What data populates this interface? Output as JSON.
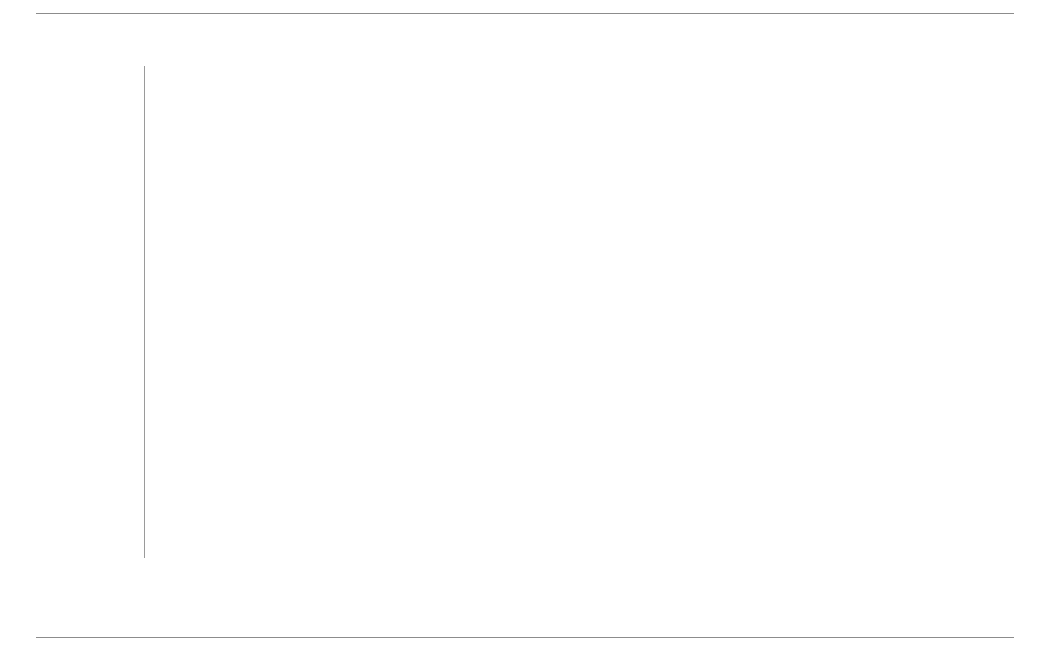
{
  "figure": {
    "rules": {
      "top": true,
      "bottom": true
    }
  },
  "axis": {
    "ticks": [
      "0%",
      "20%",
      "40%",
      "60%",
      "80%",
      "100%"
    ],
    "tick_values": [
      0,
      20,
      40,
      60,
      80,
      100
    ]
  },
  "legend": {
    "items": [
      {
        "label": "hohe emotionale Bindung",
        "color": "#8a8a8a"
      },
      {
        "label": "geringe emotionale Bindung",
        "color": "#6f6f6f"
      },
      {
        "label": "keine emotionale Bindung",
        "color": "#b4b4b4"
      }
    ]
  },
  "chart_data": {
    "type": "bar",
    "orientation": "horizontal",
    "stacked": true,
    "stack_total": 100,
    "title": "",
    "subtitle": "",
    "xlabel": "",
    "ylabel": "",
    "xlim": [
      0,
      100
    ],
    "grid": true,
    "legend_position": "bottom",
    "tick_labels": [
      "0%",
      "20%",
      "40%",
      "60%",
      "80%",
      "100%"
    ],
    "categories": [
      "USA",
      "Schweiz",
      "Österreich",
      "…",
      "Deutschland",
      "…",
      "Tschechien",
      "Singapur",
      "China"
    ],
    "series": [
      {
        "name": "hohe emotionale Bindung",
        "color": "#8a8a8a",
        "values": [
          28,
          23,
          23,
          null,
          13,
          null,
          3,
          2,
          2
        ]
      },
      {
        "name": "geringe emotionale Bindung",
        "color": "#6f6f6f",
        "values": [
          54,
          68,
          62,
          null,
          66,
          null,
          60,
          78,
          67
        ]
      },
      {
        "name": "keine emotionale Bindung",
        "color": "#b4b4b4",
        "values": [
          18,
          9,
          15,
          null,
          21,
          null,
          37,
          21,
          31
        ]
      }
    ],
    "rows": [
      {
        "category": "USA",
        "placeholder": false,
        "segments": [
          {
            "series": "hohe emotionale Bindung",
            "value": 28,
            "label": "28%",
            "color": "#8a8a8a"
          },
          {
            "series": "geringe emotionale Bindung",
            "value": 54,
            "label": "54%",
            "color": "#6f6f6f"
          },
          {
            "series": "keine emotionale Bindung",
            "value": 18,
            "label": "18%",
            "color": "#b4b4b4"
          }
        ]
      },
      {
        "category": "Schweiz",
        "placeholder": false,
        "segments": [
          {
            "series": "hohe emotionale Bindung",
            "value": 23,
            "label": "23%",
            "color": "#8a8a8a"
          },
          {
            "series": "geringe emotionale Bindung",
            "value": 68,
            "label": "68%",
            "color": "#6f6f6f"
          },
          {
            "series": "keine emotionale Bindung",
            "value": 9,
            "label": "9%",
            "color": "#b4b4b4"
          }
        ]
      },
      {
        "category": "Österreich",
        "placeholder": false,
        "segments": [
          {
            "series": "hohe emotionale Bindung",
            "value": 23,
            "label": "23%",
            "color": "#8a8a8a"
          },
          {
            "series": "geringe emotionale Bindung",
            "value": 62,
            "label": "62%",
            "color": "#6f6f6f"
          },
          {
            "series": "keine emotionale Bindung",
            "value": 15,
            "label": "15%",
            "color": "#b4b4b4"
          }
        ]
      },
      {
        "category": "…",
        "placeholder": true,
        "segments": []
      },
      {
        "category": "Deutschland",
        "placeholder": false,
        "segments": [
          {
            "series": "hohe emotionale Bindung",
            "value": 13,
            "label": "13%",
            "color": "#8a8a8a"
          },
          {
            "series": "geringe emotionale Bindung",
            "value": 66,
            "label": "66%",
            "color": "#6f6f6f"
          },
          {
            "series": "keine emotionale Bindung",
            "value": 21,
            "label": "21%",
            "color": "#b4b4b4"
          }
        ]
      },
      {
        "category": "…",
        "placeholder": true,
        "segments": []
      },
      {
        "category": "Tschechien",
        "placeholder": false,
        "segments": [
          {
            "series": "hohe emotionale Bindung",
            "value": 3,
            "label": "3%",
            "color": "#8a8a8a"
          },
          {
            "series": "geringe emotionale Bindung",
            "value": 60,
            "label": "60%",
            "color": "#6f6f6f"
          },
          {
            "series": "keine emotionale Bindung",
            "value": 37,
            "label": "37%",
            "color": "#b4b4b4"
          }
        ]
      },
      {
        "category": "Singapur",
        "placeholder": false,
        "segments": [
          {
            "series": "hohe emotionale Bindung",
            "value": 2,
            "label": "2%",
            "color": "#8a8a8a"
          },
          {
            "series": "geringe emotionale Bindung",
            "value": 78,
            "label": "78%",
            "color": "#6f6f6f"
          },
          {
            "series": "keine emotionale Bindung",
            "value": 21,
            "label": "21%",
            "color": "#b4b4b4"
          }
        ]
      },
      {
        "category": "China",
        "placeholder": false,
        "segments": [
          {
            "series": "hohe emotionale Bindung",
            "value": 2,
            "label": "2%",
            "color": "#8a8a8a"
          },
          {
            "series": "geringe emotionale Bindung",
            "value": 67,
            "label": "67%",
            "color": "#6f6f6f"
          },
          {
            "series": "keine emotionale Bindung",
            "value": 31,
            "label": "31%",
            "color": "#b4b4b4"
          }
        ]
      }
    ]
  }
}
